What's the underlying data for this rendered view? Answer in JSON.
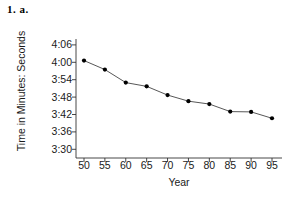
{
  "problem_label": "1. a.",
  "chart_data": {
    "type": "line",
    "title": "",
    "xlabel": "Year",
    "ylabel": "Time in Minutes: Seconds",
    "x": [
      50,
      55,
      60,
      65,
      70,
      75,
      80,
      85,
      90,
      95
    ],
    "xtick_labels": [
      "50",
      "55",
      "60",
      "65",
      "70",
      "75",
      "80",
      "85",
      "90",
      "95"
    ],
    "xlim": [
      47,
      98
    ],
    "ytick_labels": [
      "4:06",
      "4:00",
      "3:54",
      "3:48",
      "3:42",
      "3:36",
      "3:30"
    ],
    "ytick_seconds": [
      246,
      240,
      234,
      228,
      222,
      216,
      210
    ],
    "ylim_seconds": [
      207,
      247
    ],
    "values_seconds": [
      240.6,
      237.5,
      233.0,
      231.7,
      228.7,
      226.6,
      225.6,
      223.0,
      222.9,
      220.7
    ],
    "values_labels": [
      "4:00.6",
      "3:57.5",
      "3:53.0",
      "3:51.7",
      "3:48.7",
      "3:46.6",
      "3:45.6",
      "3:43.0",
      "3:42.9",
      "3:40.7"
    ],
    "grid": false,
    "legend": null,
    "marker": "filled-circle",
    "line_color": "#444444",
    "marker_color": "#000000"
  }
}
